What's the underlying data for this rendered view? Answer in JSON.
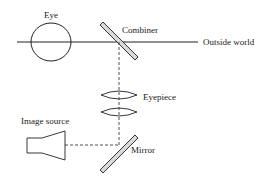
{
  "diagram": {
    "type": "optical-schematic",
    "labels": {
      "eye": "Eye",
      "combiner": "Combiner",
      "outside_world": "Outside world",
      "eyepiece": "Eyepiece",
      "image_source": "Image source",
      "mirror": "Mirror"
    },
    "components": [
      {
        "id": "eye",
        "shape": "circle"
      },
      {
        "id": "combiner",
        "shape": "diagonal-plate"
      },
      {
        "id": "eyepiece",
        "shape": "two-lenses"
      },
      {
        "id": "mirror",
        "shape": "diagonal-plate"
      },
      {
        "id": "image_source",
        "shape": "trapezoid-tube"
      }
    ],
    "paths": [
      {
        "from": "eye",
        "to": "outside_world",
        "style": "solid"
      },
      {
        "from": "combiner",
        "to": "mirror",
        "style": "dashed",
        "via": "eyepiece"
      },
      {
        "from": "image_source",
        "to": "mirror",
        "style": "dashed"
      }
    ],
    "colors": {
      "stroke": "#222222",
      "plate_fill": "#d9d9d9",
      "background": "#ffffff"
    }
  }
}
